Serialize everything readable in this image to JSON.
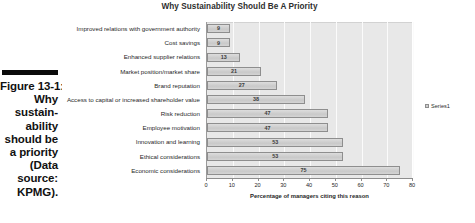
{
  "caption": {
    "lines": [
      "Figure 13-1:",
      "Why",
      "sustain-",
      "ability",
      "should be",
      "a priority",
      "(Data",
      "source:",
      "KPMG)."
    ]
  },
  "legend": {
    "label": "Series1",
    "swatch_color": "#cfcfcf",
    "position": "right"
  },
  "chart_data": {
    "type": "bar",
    "orientation": "horizontal",
    "title": "Why Sustainability Should Be A Priority",
    "xlabel": "Percentage of managers citing this reason",
    "ylabel": "",
    "xlim": [
      0,
      80
    ],
    "xticks": [
      0,
      10,
      20,
      30,
      40,
      50,
      60,
      70,
      80
    ],
    "grid": true,
    "series": [
      {
        "name": "Series1",
        "values": [
          9,
          9,
          13,
          21,
          27,
          38,
          47,
          47,
          53,
          53,
          75
        ]
      }
    ],
    "categories": [
      "Improved relations with government authority",
      "Cost savings",
      "Enhanced supplier relations",
      "Market position/market share",
      "Brand reputation",
      "Access to capital or increased shareholder value",
      "Risk reduction",
      "Employee motivation",
      "Innovation and learning",
      "Ethical considerations",
      "Economic considerations"
    ],
    "data_labels": [
      "9",
      "9",
      "13",
      "21",
      "27",
      "38",
      "47",
      "47",
      "53",
      "53",
      "75"
    ],
    "plot_bg_color": "#e8e8e8",
    "bar_color": "#cfcfcf",
    "bar_border_color": "#8e8e8e"
  }
}
